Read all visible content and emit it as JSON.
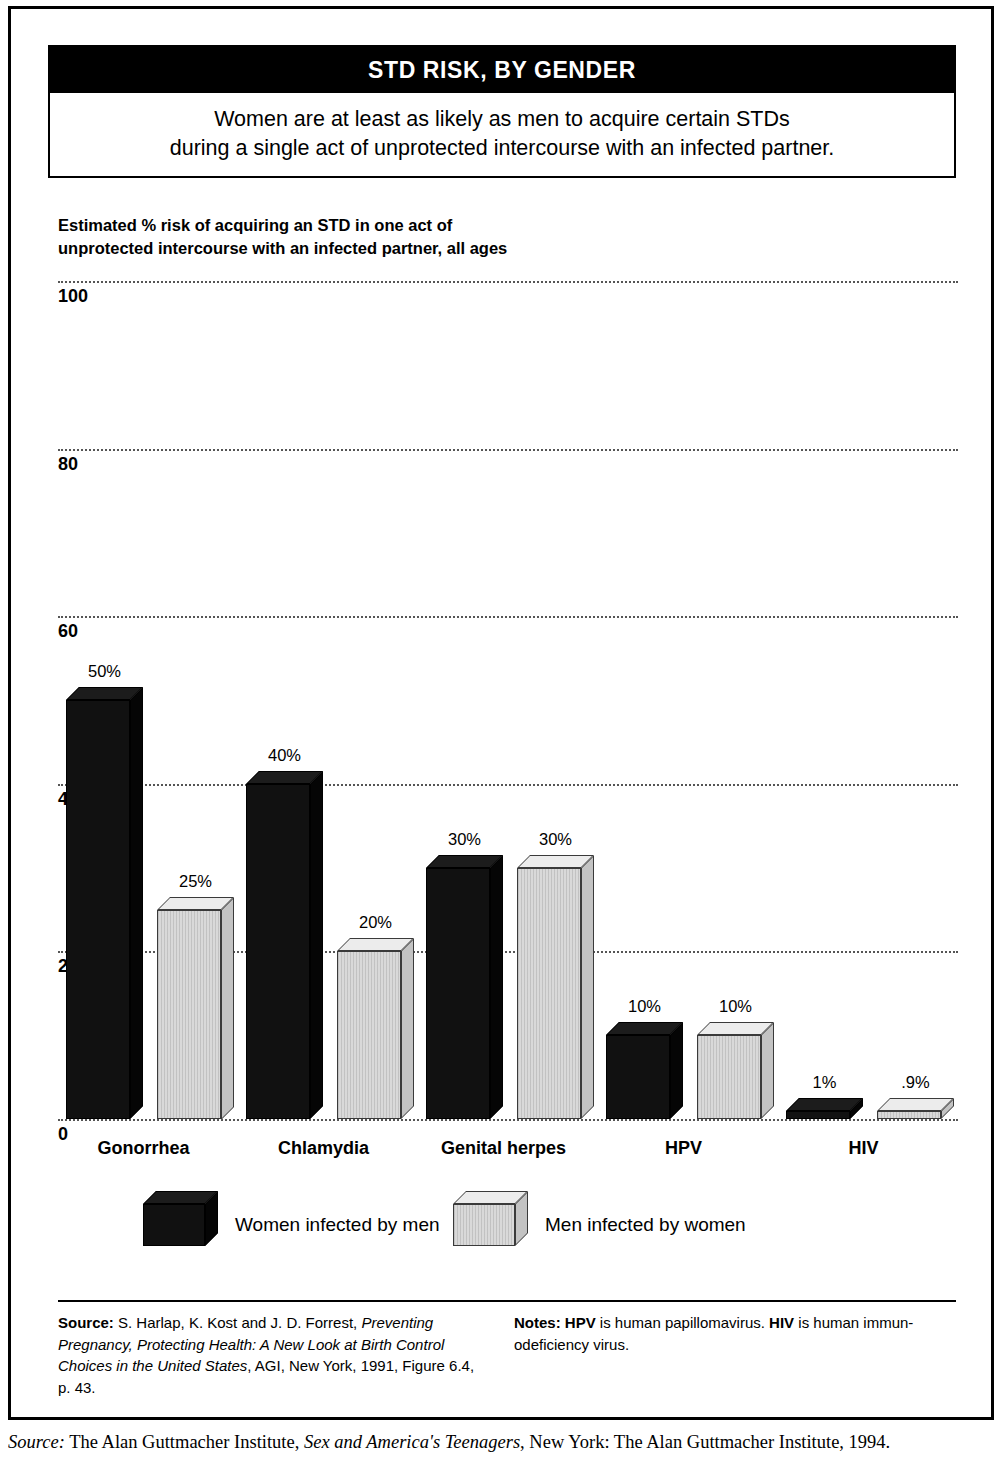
{
  "figure": {
    "title": "STD RISK, BY GENDER",
    "subtitle_line1": "Women are at least as likely as men to acquire certain STDs",
    "subtitle_line2": "during a single act of unprotected intercourse with an infected partner.",
    "axis_caption_line1": "Estimated % risk of acquiring an STD in one act of",
    "axis_caption_line2": "unprotected intercourse with an infected partner, all ages"
  },
  "chart_data": {
    "type": "bar",
    "title": "STD RISK, BY GENDER",
    "subtitle": "Women are at least as likely as men to acquire certain STDs during a single act of unprotected intercourse with an infected partner.",
    "xlabel": "",
    "ylabel": "Estimated % risk of acquiring an STD in one act of unprotected intercourse with an infected partner, all ages",
    "ylim": [
      0,
      100
    ],
    "yticks": [
      0,
      20,
      40,
      60,
      80,
      100
    ],
    "ytick_labels": [
      "0",
      "20",
      "40",
      "60",
      "80",
      "100"
    ],
    "grid": true,
    "grid_style": "dotted-horizontal",
    "legend_position": "below-plot",
    "categories": [
      "Gonorrhea",
      "Chlamydia",
      "Genital herpes",
      "HPV",
      "HIV"
    ],
    "series": [
      {
        "name": "Women infected by men",
        "color": "#111111",
        "values": [
          50,
          40,
          30,
          10,
          1
        ],
        "labels": [
          "50%",
          "40%",
          "30%",
          "10%",
          "1%"
        ]
      },
      {
        "name": "Men infected by women",
        "color": "#d9d9d9",
        "values": [
          25,
          20,
          30,
          10,
          0.9
        ],
        "labels": [
          "25%",
          "20%",
          "30%",
          "10%",
          ".9%"
        ]
      }
    ]
  },
  "legend": {
    "items": [
      {
        "label": "Women infected by men",
        "swatch": "dark"
      },
      {
        "label": "Men infected by women",
        "swatch": "light"
      }
    ]
  },
  "footer": {
    "source_label": "Source:",
    "source_text_1": " S. Harlap, K. Kost and J. D. Forrest, ",
    "source_italic": "Preventing Pregnancy, Protecting Health: A New Look at Birth Control Choices in the United States",
    "source_text_2": ", AGI, New York, 1991, Figure 6.4, p. 43.",
    "notes_label": "Notes:",
    "notes_text_1": " ",
    "notes_bold_1": "HPV",
    "notes_text_2": " is human papillomavirus. ",
    "notes_bold_2": "HIV",
    "notes_text_3": " is human immun-odeficiency virus."
  },
  "page_caption": {
    "label": "Source:",
    "text_1": " The Alan Guttmacher Institute, ",
    "italic": "Sex and America's Teenagers",
    "text_2": ", New York: The Alan Guttmacher Institute, 1994."
  }
}
